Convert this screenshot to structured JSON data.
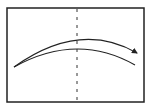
{
  "diagram": {
    "frame": {
      "x": 7,
      "y": 8,
      "width": 137,
      "height": 94,
      "stroke": "#222222"
    },
    "axis": {
      "x": 77,
      "y1": 8,
      "y2": 102,
      "style": "dashed",
      "stroke": "#333333"
    },
    "arcs": [
      {
        "name": "upper-arc-with-arrow",
        "start": [
          14,
          67
        ],
        "control": [
          80,
          20
        ],
        "end": [
          137,
          53
        ],
        "arrow": true
      },
      {
        "name": "lower-arc",
        "start": [
          14,
          67
        ],
        "control": [
          77,
          32
        ],
        "end": [
          135,
          65
        ],
        "arrow": false
      }
    ],
    "colors": {
      "line": "#222222",
      "background": "#ffffff"
    }
  }
}
